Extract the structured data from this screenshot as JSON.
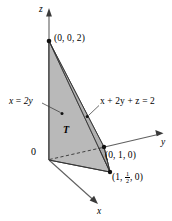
{
  "figure": {
    "background_color": "#ffffff",
    "stroke_color": "#000000",
    "axes": [
      {
        "name": "z-axis",
        "label": "z",
        "x": 47,
        "y": 7
      },
      {
        "name": "y-axis",
        "label": "y",
        "x": 162,
        "y": 137
      },
      {
        "name": "x-axis",
        "label": "x",
        "x": 97,
        "y": 208
      }
    ],
    "origin": {
      "label": "0",
      "x": 32,
      "y": 148
    },
    "region_label": {
      "label": "T",
      "x": 63,
      "y": 126
    },
    "vertices": [
      {
        "name": "vertex-z",
        "label": "(0, 0, 2)",
        "label_x": 54,
        "label_y": 35,
        "px": 49,
        "py": 41
      },
      {
        "name": "vertex-y",
        "label": "(0, 1, 0)",
        "label_x": 106,
        "label_y": 152,
        "px": 104,
        "py": 147
      },
      {
        "name": "vertex-x",
        "label_prefix": "(1, ",
        "label_num": "1",
        "label_den": "2",
        "label_suffix": ", 0)",
        "label_x": 113,
        "label_y": 172,
        "px": 110,
        "py": 172
      },
      {
        "name": "vertex-origin",
        "label": "",
        "px": 49,
        "py": 160
      }
    ],
    "annotations": [
      {
        "name": "plane-x-equals-2y",
        "text": "x = 2y",
        "parts": {
          "lhs": "x",
          "op": " = ",
          "rhs": "2y"
        },
        "x": 9,
        "y": 98,
        "leader_from": [
          42,
          104
        ],
        "leader_to": [
          61,
          113
        ],
        "dot": [
          62,
          114
        ]
      },
      {
        "name": "plane-equation",
        "text": "x + 2y + z = 2",
        "x": 101,
        "y": 98,
        "leader_from": [
          99,
          106
        ],
        "leader_to": [
          88,
          116
        ],
        "dot": [
          87,
          117
        ]
      }
    ],
    "colors": {
      "face_front": "#b9b9b9",
      "face_side": "#a0a0a0",
      "face_bottom": "#aeaeae",
      "face_slant": "#c4c4c4",
      "axis": "#555555",
      "ink": "#000000"
    }
  }
}
